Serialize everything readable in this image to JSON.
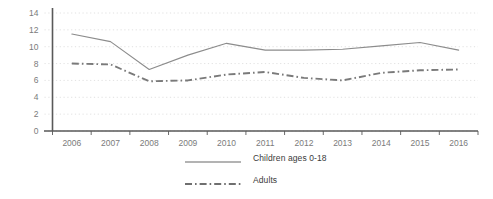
{
  "chart_data": {
    "type": "line",
    "title": "",
    "subtitle": "",
    "xlabel": "",
    "ylabel": "",
    "categories": [
      "2006",
      "2007",
      "2008",
      "2009",
      "2010",
      "2011",
      "2012",
      "2013",
      "2014",
      "2015",
      "2016"
    ],
    "series": [
      {
        "name": "Children ages 0-18",
        "style": "solid",
        "color": "#8c8c8c",
        "values": [
          11.5,
          10.6,
          7.3,
          9.0,
          10.4,
          9.6,
          9.6,
          9.7,
          10.1,
          10.5,
          9.6
        ]
      },
      {
        "name": "Adults",
        "style": "dash-dot",
        "color": "#7a7a7a",
        "values": [
          8.0,
          7.9,
          5.9,
          6.0,
          6.7,
          7.0,
          6.3,
          6.0,
          6.9,
          7.2,
          7.3
        ]
      }
    ],
    "ylim": [
      0,
      14
    ],
    "yticks": [
      0,
      2,
      4,
      6,
      8,
      10,
      12,
      14
    ],
    "ytick_labels": [
      "0",
      "2",
      "4",
      "6",
      "8",
      "10",
      "12",
      "14"
    ],
    "grid": true,
    "grid_style": "dotted-horizontal",
    "grid_color": "#d9d9d9",
    "legend_position": "bottom-center",
    "axis_color": "#595959"
  },
  "legend": {
    "items": [
      {
        "label": "Children ages 0-18",
        "style": "solid"
      },
      {
        "label": "Adults",
        "style": "dash-dot"
      }
    ]
  },
  "axes": {
    "y": {
      "labels": [
        "14",
        "12",
        "10",
        "8",
        "6",
        "4",
        "2",
        "0"
      ]
    },
    "x": {
      "labels": [
        "2006",
        "2007",
        "2008",
        "2009",
        "2010",
        "2011",
        "2012",
        "2013",
        "2014",
        "2015",
        "2016"
      ]
    }
  }
}
